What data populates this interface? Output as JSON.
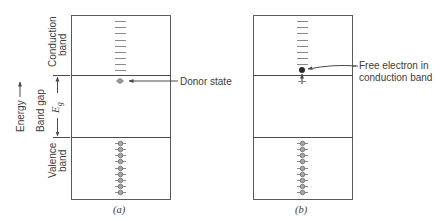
{
  "panels": [
    {
      "id": "a",
      "caption": "(a)",
      "box": {
        "x": 71,
        "y": 15,
        "w": 99,
        "h": 184
      },
      "conduction_line_y": 75,
      "valence_line_y": 137,
      "conduction_ticks": 9,
      "valence_dots": 9,
      "annotation": "Donor state"
    },
    {
      "id": "b",
      "caption": "(b)",
      "box": {
        "x": 253,
        "y": 15,
        "w": 99,
        "h": 184
      },
      "conduction_line_y": 75,
      "valence_line_y": 137,
      "conduction_ticks": 8,
      "valence_dots": 9,
      "annotation_line1": "Free electron in",
      "annotation_line2": "conduction band"
    }
  ],
  "side_labels": {
    "energy": "Energy",
    "band_gap": "Band gap",
    "conduction_line1": "Conduction",
    "conduction_line2": "band",
    "valence_line1": "Valence",
    "valence_line2": "band",
    "gap_symbol": "E",
    "gap_subscript": "g"
  },
  "colors": {
    "line": "#5a5a5a",
    "dot_fill": "#9a9a9a",
    "electron": "#2a2a2a"
  }
}
